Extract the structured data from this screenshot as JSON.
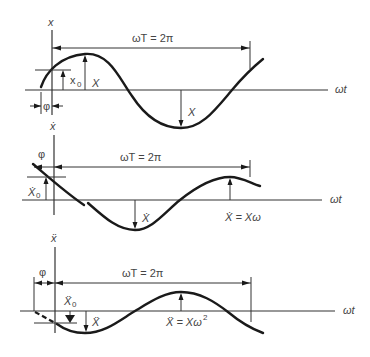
{
  "figure": {
    "panels": [
      {
        "id": "displacement",
        "y_axis_label": "x",
        "x_axis_label": "ωt",
        "period_label": "ωT = 2π",
        "phase_label": "φ",
        "initial_label": "x",
        "initial_sub": "0",
        "amplitude_label": "X",
        "amplitude_label_2": "X",
        "peak_label": ""
      },
      {
        "id": "velocity",
        "y_axis_label": "ẋ",
        "x_axis_label": "ωt",
        "period_label": "ωT = 2π",
        "phase_label": "φ",
        "initial_label": "Ẋ",
        "initial_sub": "0",
        "amplitude_label": "Ẋ",
        "peak_label": "Ẋ = Xω"
      },
      {
        "id": "acceleration",
        "y_axis_label": "ẍ",
        "x_axis_label": "ωt",
        "period_label": "ωT = 2π",
        "phase_label": "φ",
        "initial_label": "Ẍ",
        "initial_sub": "0",
        "amplitude_label": "Ẍ",
        "peak_label_main": "Ẍ = Xω",
        "peak_label_sup": "2"
      }
    ]
  }
}
